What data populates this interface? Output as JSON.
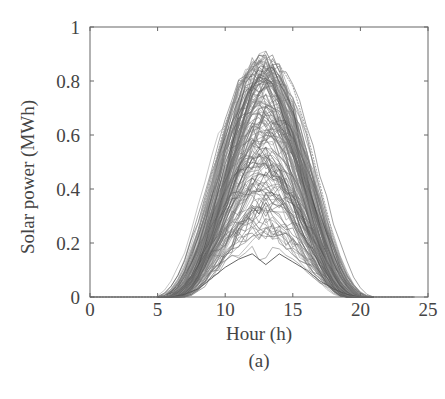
{
  "chart_data": {
    "type": "line",
    "title": "",
    "caption": "(a)",
    "xlabel": "Hour (h)",
    "ylabel": "Solar power (MWh)",
    "xlim": [
      0,
      25
    ],
    "ylim": [
      0,
      1
    ],
    "xticks": [
      0,
      5,
      10,
      15,
      20,
      25
    ],
    "yticks": [
      0,
      0.2,
      0.4,
      0.6,
      0.8,
      1
    ],
    "ytick_labels": [
      "0",
      "0.2",
      "0.4",
      "0.6",
      "0.8",
      "1"
    ],
    "xtick_labels": [
      "0",
      "5",
      "10",
      "15",
      "20",
      "25"
    ],
    "grid": false,
    "legend": null,
    "line_color": "#555555",
    "x": [
      0,
      1,
      2,
      3,
      4,
      5,
      6,
      7,
      8,
      9,
      10,
      11,
      12,
      13,
      14,
      15,
      16,
      17,
      18,
      19,
      20,
      21,
      22,
      23,
      24
    ],
    "envelope": {
      "max": [
        0,
        0,
        0,
        0,
        0,
        0,
        0.01,
        0.08,
        0.24,
        0.45,
        0.64,
        0.78,
        0.86,
        0.885,
        0.86,
        0.78,
        0.62,
        0.42,
        0.22,
        0.07,
        0.01,
        0,
        0,
        0,
        0
      ],
      "min": [
        0,
        0,
        0,
        0,
        0,
        0,
        0,
        0.01,
        0.03,
        0.07,
        0.11,
        0.14,
        0.16,
        0.12,
        0.16,
        0.13,
        0.1,
        0.06,
        0.03,
        0.01,
        0,
        0,
        0,
        0,
        0
      ]
    },
    "series_count_approx": 365
  }
}
